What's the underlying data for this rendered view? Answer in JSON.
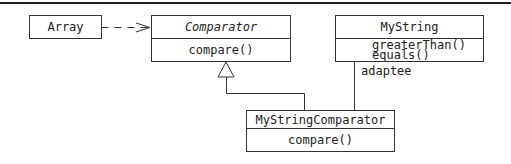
{
  "diagram": {
    "type": "UML class diagram",
    "classes": [
      {
        "id": "array",
        "name": "Array",
        "abstract": false,
        "methods": []
      },
      {
        "id": "comparator",
        "name": "Comparator",
        "abstract": true,
        "methods": [
          "compare()"
        ]
      },
      {
        "id": "mystring",
        "name": "MyString",
        "abstract": false,
        "methods": [
          "greaterThan()",
          "equals()"
        ]
      },
      {
        "id": "mystringcomparator",
        "name": "MyStringComparator",
        "abstract": false,
        "methods": [
          "compare()"
        ]
      }
    ],
    "relations": [
      {
        "from": "array",
        "to": "comparator",
        "kind": "dependency",
        "label": ""
      },
      {
        "from": "mystringcomparator",
        "to": "comparator",
        "kind": "generalization",
        "label": ""
      },
      {
        "from": "mystringcomparator",
        "to": "mystring",
        "kind": "association",
        "label": "adaptee"
      }
    ],
    "adaptee_label": "adaptee"
  }
}
